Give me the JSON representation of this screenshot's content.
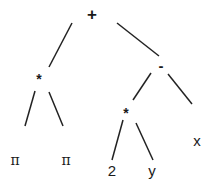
{
  "diagram": {
    "type": "expression-tree",
    "edge_color": "#222222",
    "nodes": [
      {
        "id": "root",
        "label": "+",
        "x": 92,
        "y": 14
      },
      {
        "id": "mul1",
        "label": "*",
        "x": 39,
        "y": 76
      },
      {
        "id": "sub",
        "label": "-",
        "x": 161,
        "y": 66
      },
      {
        "id": "pi1",
        "label": "π",
        "x": 15,
        "y": 161
      },
      {
        "id": "pi2",
        "label": "π",
        "x": 66,
        "y": 161
      },
      {
        "id": "mul2",
        "label": "*",
        "x": 126,
        "y": 111
      },
      {
        "id": "x",
        "label": "x",
        "x": 197,
        "y": 141
      },
      {
        "id": "two",
        "label": "2",
        "x": 112,
        "y": 171
      },
      {
        "id": "y",
        "label": "y",
        "x": 152,
        "y": 171
      }
    ],
    "edges": [
      {
        "from": "root",
        "to": "mul1",
        "x1": 72,
        "y1": 23,
        "x2": 49,
        "y2": 67
      },
      {
        "from": "root",
        "to": "sub",
        "x1": 117,
        "y1": 23,
        "x2": 159,
        "y2": 56
      },
      {
        "from": "mul1",
        "to": "pi1",
        "x1": 35,
        "y1": 91,
        "x2": 25,
        "y2": 126
      },
      {
        "from": "mul1",
        "to": "pi2",
        "x1": 49,
        "y1": 92,
        "x2": 63,
        "y2": 126
      },
      {
        "from": "sub",
        "to": "mul2",
        "x1": 151,
        "y1": 73,
        "x2": 133,
        "y2": 100
      },
      {
        "from": "sub",
        "to": "x",
        "x1": 168,
        "y1": 74,
        "x2": 192,
        "y2": 104
      },
      {
        "from": "mul2",
        "to": "two",
        "x1": 123,
        "y1": 120,
        "x2": 112,
        "y2": 160
      },
      {
        "from": "mul2",
        "to": "y",
        "x1": 136,
        "y1": 123,
        "x2": 153,
        "y2": 160
      }
    ]
  }
}
